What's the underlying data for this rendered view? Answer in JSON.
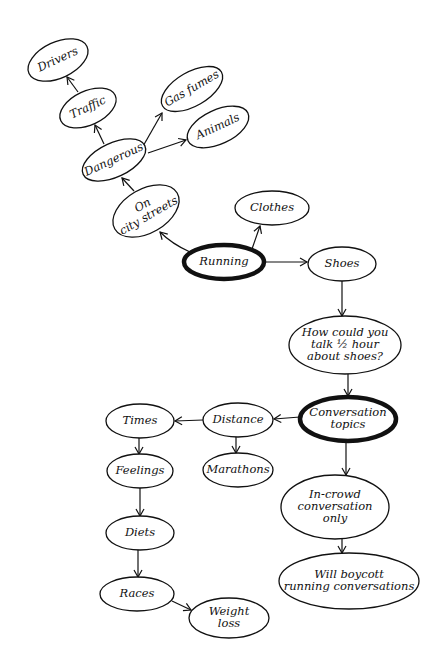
{
  "diagram": {
    "type": "mind-map",
    "style": "hand-drawn",
    "colors": {
      "ink": "#111111",
      "background": "#ffffff"
    },
    "nodes": [
      {
        "id": "running",
        "lines": [
          "Running"
        ],
        "cx": 224,
        "cy": 262,
        "rx": 40,
        "ry": 17,
        "rot": 0,
        "bold": true
      },
      {
        "id": "on_city_streets",
        "lines": [
          "On",
          "city streets"
        ],
        "cx": 146,
        "cy": 211,
        "rx": 36,
        "ry": 22,
        "rot": -30,
        "bold": false
      },
      {
        "id": "dangerous",
        "lines": [
          "Dangerous"
        ],
        "cx": 114,
        "cy": 160,
        "rx": 34,
        "ry": 17,
        "rot": -25,
        "bold": false
      },
      {
        "id": "traffic",
        "lines": [
          "Traffic"
        ],
        "cx": 88,
        "cy": 108,
        "rx": 30,
        "ry": 17,
        "rot": -25,
        "bold": false
      },
      {
        "id": "drivers",
        "lines": [
          "Drivers"
        ],
        "cx": 58,
        "cy": 60,
        "rx": 32,
        "ry": 18,
        "rot": -25,
        "bold": false
      },
      {
        "id": "gas_fumes",
        "lines": [
          "Gas fumes"
        ],
        "cx": 192,
        "cy": 89,
        "rx": 34,
        "ry": 17,
        "rot": -30,
        "bold": false
      },
      {
        "id": "animals",
        "lines": [
          "Animals"
        ],
        "cx": 218,
        "cy": 127,
        "rx": 33,
        "ry": 17,
        "rot": -25,
        "bold": false
      },
      {
        "id": "clothes",
        "lines": [
          "Clothes"
        ],
        "cx": 272,
        "cy": 208,
        "rx": 37,
        "ry": 17,
        "rot": 0,
        "bold": false
      },
      {
        "id": "shoes",
        "lines": [
          "Shoes"
        ],
        "cx": 342,
        "cy": 264,
        "rx": 34,
        "ry": 17,
        "rot": 0,
        "bold": false
      },
      {
        "id": "how_could_you",
        "lines": [
          "How could you",
          "talk ½ hour",
          "about shoes?"
        ],
        "cx": 345,
        "cy": 345,
        "rx": 56,
        "ry": 29,
        "rot": 0,
        "bold": false
      },
      {
        "id": "conversation_topics",
        "lines": [
          "Conversation",
          "topics"
        ],
        "cx": 348,
        "cy": 419,
        "rx": 48,
        "ry": 22,
        "rot": 0,
        "bold": true
      },
      {
        "id": "distance",
        "lines": [
          "Distance"
        ],
        "cx": 238,
        "cy": 420,
        "rx": 35,
        "ry": 17,
        "rot": 0,
        "bold": false
      },
      {
        "id": "marathons",
        "lines": [
          "Marathons"
        ],
        "cx": 238,
        "cy": 470,
        "rx": 35,
        "ry": 17,
        "rot": 0,
        "bold": false
      },
      {
        "id": "times",
        "lines": [
          "Times"
        ],
        "cx": 140,
        "cy": 421,
        "rx": 34,
        "ry": 17,
        "rot": 0,
        "bold": false
      },
      {
        "id": "feelings",
        "lines": [
          "Feelings"
        ],
        "cx": 140,
        "cy": 471,
        "rx": 33,
        "ry": 17,
        "rot": 0,
        "bold": false
      },
      {
        "id": "diets",
        "lines": [
          "Diets"
        ],
        "cx": 140,
        "cy": 533,
        "rx": 34,
        "ry": 17,
        "rot": 0,
        "bold": false
      },
      {
        "id": "races",
        "lines": [
          "Races"
        ],
        "cx": 137,
        "cy": 594,
        "rx": 37,
        "ry": 17,
        "rot": 0,
        "bold": false
      },
      {
        "id": "weight_loss",
        "lines": [
          "Weight",
          "loss"
        ],
        "cx": 229,
        "cy": 618,
        "rx": 40,
        "ry": 20,
        "rot": 0,
        "bold": false
      },
      {
        "id": "in_crowd",
        "lines": [
          "In-crowd",
          "conversation",
          "only"
        ],
        "cx": 335,
        "cy": 507,
        "rx": 54,
        "ry": 32,
        "rot": 0,
        "bold": false
      },
      {
        "id": "will_boycott",
        "lines": [
          "Will boycott",
          "running conversations"
        ],
        "cx": 349,
        "cy": 581,
        "rx": 70,
        "ry": 28,
        "rot": 0,
        "bold": false
      }
    ],
    "edges": [
      {
        "from": "running",
        "to": "on_city_streets",
        "path": "M 190 252 Q 172 244 160 232"
      },
      {
        "from": "running",
        "to": "clothes",
        "path": "M 252 249 L 260 226"
      },
      {
        "from": "running",
        "to": "shoes",
        "path": "M 264 262 L 307 262"
      },
      {
        "from": "on_city_streets",
        "to": "dangerous",
        "path": "M 134 191 L 122 178"
      },
      {
        "from": "dangerous",
        "to": "traffic",
        "path": "M 104 144 L 95 125"
      },
      {
        "from": "traffic",
        "to": "drivers",
        "path": "M 78 92 L 67 77"
      },
      {
        "from": "dangerous",
        "to": "gas_fumes",
        "path": "M 142 148 L 162 113"
      },
      {
        "from": "dangerous",
        "to": "animals",
        "path": "M 148 153 L 186 140"
      },
      {
        "from": "shoes",
        "to": "how_could_you",
        "path": "M 342 281 L 342 316"
      },
      {
        "from": "how_could_you",
        "to": "conversation_topics",
        "path": "M 348 374 L 348 396"
      },
      {
        "from": "conversation_topics",
        "to": "distance",
        "path": "M 300 417 L 274 419"
      },
      {
        "from": "distance",
        "to": "times",
        "path": "M 203 420 L 175 421"
      },
      {
        "from": "distance",
        "to": "marathons",
        "path": "M 236 437 L 236 453"
      },
      {
        "from": "times",
        "to": "feelings",
        "path": "M 139 438 L 139 454"
      },
      {
        "from": "feelings",
        "to": "diets",
        "path": "M 140 488 L 140 516"
      },
      {
        "from": "diets",
        "to": "races",
        "path": "M 138 550 L 138 577"
      },
      {
        "from": "races",
        "to": "weight_loss",
        "path": "M 172 601 L 191 610"
      },
      {
        "from": "conversation_topics",
        "to": "in_crowd",
        "path": "M 346 441 L 346 475"
      },
      {
        "from": "in_crowd",
        "to": "will_boycott",
        "path": "M 342 539 L 342 553"
      }
    ]
  }
}
